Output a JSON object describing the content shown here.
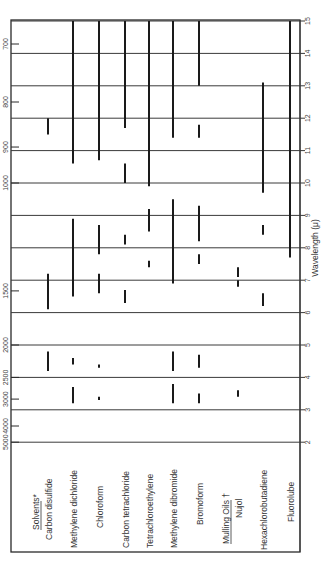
{
  "chart_data": {
    "type": "range_bar",
    "orientation": "rotated 90 degrees (read bottom-to-top)",
    "title": "",
    "xlabel": "Wavelength (μ)",
    "ylabel": "",
    "xlim": [
      2,
      15
    ],
    "wavelength_ticks": [
      "2",
      "3",
      "4",
      "5",
      "6",
      "7",
      "8",
      "9",
      "10",
      "11",
      "12",
      "13",
      "14",
      "15"
    ],
    "wavenumber_ticks": [
      {
        "label": "5000",
        "um": 2.0
      },
      {
        "label": "4000",
        "um": 2.5
      },
      {
        "label": "3000",
        "um": 3.33
      },
      {
        "label": "2500",
        "um": 4.0
      },
      {
        "label": "2000",
        "um": 5.0
      },
      {
        "label": "1500",
        "um": 6.67
      },
      {
        "label": "1000",
        "um": 10.0
      },
      {
        "label": "900",
        "um": 11.11
      },
      {
        "label": "800",
        "um": 12.5
      },
      {
        "label": "700",
        "um": 14.29
      }
    ],
    "grid": true,
    "groups": [
      {
        "heading": "Solvents*",
        "items": [
          0,
          1,
          2,
          3,
          4,
          5,
          6
        ]
      },
      {
        "heading": "Mulling Oils †",
        "items": [
          7,
          8,
          9
        ]
      }
    ],
    "series": [
      {
        "name": "Carbon disulfide",
        "absorption_ranges_um": [
          [
            4.2,
            4.8
          ],
          [
            6.1,
            7.2
          ],
          [
            11.5,
            12.0
          ]
        ]
      },
      {
        "name": "Methylene dichloride",
        "absorption_ranges_um": [
          [
            3.2,
            3.7
          ],
          [
            4.4,
            4.6
          ],
          [
            6.5,
            8.9
          ],
          [
            10.6,
            15.0
          ]
        ]
      },
      {
        "name": "Chloroform",
        "absorption_ranges_um": [
          [
            3.3,
            3.4
          ],
          [
            4.3,
            4.4
          ],
          [
            6.6,
            7.2
          ],
          [
            7.8,
            8.7
          ],
          [
            10.7,
            15.0
          ]
        ]
      },
      {
        "name": "Carbon tetrachloride",
        "absorption_ranges_um": [
          [
            6.3,
            6.7
          ],
          [
            8.1,
            8.4
          ],
          [
            10.0,
            10.6
          ],
          [
            11.7,
            15.0
          ]
        ]
      },
      {
        "name": "Tetrachloroethylene",
        "absorption_ranges_um": [
          [
            7.4,
            7.6
          ],
          [
            8.5,
            9.2
          ],
          [
            9.9,
            15.0
          ]
        ]
      },
      {
        "name": "Methylene dibromide",
        "absorption_ranges_um": [
          [
            3.2,
            3.8
          ],
          [
            4.2,
            4.8
          ],
          [
            6.9,
            9.5
          ],
          [
            11.4,
            15.0
          ]
        ]
      },
      {
        "name": "Bromoform",
        "absorption_ranges_um": [
          [
            3.2,
            3.5
          ],
          [
            4.3,
            4.7
          ],
          [
            7.5,
            7.8
          ],
          [
            8.2,
            9.3
          ],
          [
            11.4,
            11.8
          ],
          [
            13.0,
            15.0
          ]
        ]
      },
      {
        "name": "Nujol",
        "absorption_ranges_um": [
          [
            3.4,
            3.6
          ],
          [
            6.8,
            7.0
          ],
          [
            7.1,
            7.4
          ]
        ]
      },
      {
        "name": "Hexachlorobutadiene",
        "absorption_ranges_um": [
          [
            6.2,
            6.6
          ],
          [
            8.4,
            8.7
          ],
          [
            9.7,
            13.1
          ]
        ]
      },
      {
        "name": "Fluorolube",
        "absorption_ranges_um": [
          [
            7.7,
            15.0
          ]
        ]
      }
    ]
  },
  "labels": {
    "solvents_heading": "Solvents*",
    "mulling_heading": "Mulling Oils †",
    "axis_title": "Wavelength (μ)",
    "rows": [
      "Carbon disulfide",
      "Methylene dichloride",
      "Chloroform",
      "Carbon tetrachloride",
      "Tetrachloroethylene",
      "Methylene dibromide",
      "Bromoform",
      "Nujol",
      "Hexachlorobutadiene",
      "Fluorolube"
    ]
  }
}
